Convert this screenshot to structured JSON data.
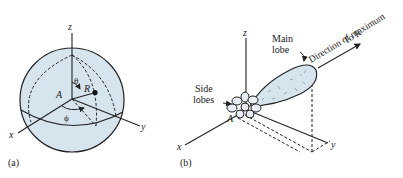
{
  "panel_a": {
    "caption": "(a)",
    "axes": {
      "x": "x",
      "y": "y",
      "z": "z"
    },
    "origin_label": "A",
    "point_label": "R",
    "theta_label": "θ",
    "phi_label": "ϕ",
    "sphere_fill": "#d6e4ee"
  },
  "panel_b": {
    "caption": "(b)",
    "axes": {
      "x": "x",
      "y": "y",
      "z": "z"
    },
    "origin_label": "A",
    "main_lobe_label_1": "Main",
    "main_lobe_label_2": "lobe",
    "side_lobes_label_1": "Side",
    "side_lobes_label_2": "lobes",
    "direction_label_1": "Direction of maximum",
    "direction_label_2": "To R",
    "lobe_fill": "#d6e4ee"
  }
}
